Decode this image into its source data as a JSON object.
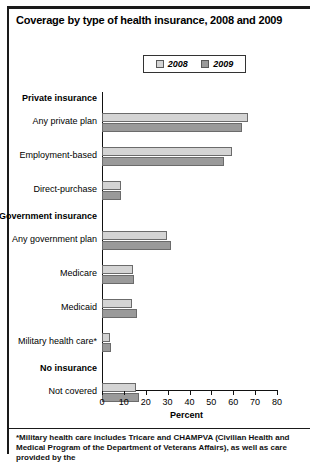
{
  "figure": {
    "title": "Coverage by type of health insurance, 2008 and 2009",
    "footnote": "*Military health care includes Tricare and CHAMPVA (Civilian Health and Medical Program of the Department of Veterans Affairs), as well as care provided by the"
  },
  "legend": {
    "items": [
      {
        "label": "2008",
        "color": "#d4d4d4"
      },
      {
        "label": "2009",
        "color": "#9a9a9a"
      }
    ]
  },
  "chart_data": {
    "type": "bar",
    "orientation": "horizontal",
    "title": "Coverage by type of health insurance, 2008 and 2009",
    "xlabel": "Percent",
    "ylabel": "",
    "xlim": [
      0,
      80
    ],
    "xticks": [
      0,
      10,
      20,
      30,
      40,
      50,
      60,
      70,
      80
    ],
    "grid": false,
    "legend_position": "top-center",
    "categories": [
      "Any private plan",
      "Employment-based",
      "Direct-purchase",
      "Any government plan",
      "Medicare",
      "Medicaid",
      "Military health care*",
      "Not covered"
    ],
    "groups": [
      {
        "label": "Private insurance",
        "categories": [
          "Any private plan",
          "Employment-based",
          "Direct-purchase"
        ]
      },
      {
        "label": "Government insurance",
        "categories": [
          "Any government plan",
          "Medicare",
          "Medicaid",
          "Military health care*"
        ]
      },
      {
        "label": "No insurance",
        "categories": [
          "Not covered"
        ]
      }
    ],
    "series": [
      {
        "name": "2008",
        "color": "#d4d4d4",
        "values": [
          66.7,
          59.6,
          8.8,
          29.6,
          14.3,
          13.8,
          3.8,
          15.4
        ]
      },
      {
        "name": "2009",
        "color": "#9a9a9a",
        "values": [
          63.9,
          55.8,
          8.9,
          31.6,
          14.4,
          15.8,
          4.1,
          16.7
        ]
      }
    ]
  },
  "xaxis": {
    "title": "Percent",
    "tick_labels": [
      "0",
      "10",
      "20",
      "30",
      "40",
      "50",
      "60",
      "70",
      "80"
    ]
  }
}
